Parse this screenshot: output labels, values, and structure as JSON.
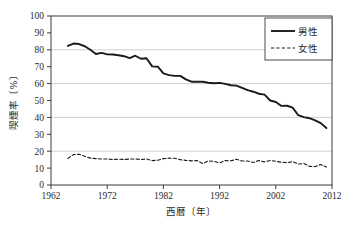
{
  "chart_data": {
    "type": "line",
    "title": "",
    "xlabel": "西暦〔年〕",
    "ylabel": "喫煙率〔%〕",
    "xlim": [
      1962,
      2012
    ],
    "ylim": [
      0,
      100
    ],
    "xticks": [
      1962,
      1972,
      1982,
      1992,
      2002,
      2012
    ],
    "yticks": [
      0,
      10,
      20,
      30,
      40,
      50,
      60,
      70,
      80,
      90,
      100
    ],
    "gridlines_y": [
      20,
      40,
      60,
      80
    ],
    "grid": true,
    "legend_position": "top-right",
    "x": [
      1965,
      1966,
      1967,
      1968,
      1969,
      1970,
      1971,
      1972,
      1973,
      1974,
      1975,
      1976,
      1977,
      1978,
      1979,
      1980,
      1981,
      1982,
      1983,
      1984,
      1985,
      1986,
      1987,
      1988,
      1989,
      1990,
      1991,
      1992,
      1993,
      1994,
      1995,
      1996,
      1997,
      1998,
      1999,
      2000,
      2001,
      2002,
      2003,
      2004,
      2005,
      2006,
      2007,
      2008,
      2009,
      2010,
      2011
    ],
    "series": [
      {
        "name": "男性",
        "style": "solid",
        "color": "#1a1a1a",
        "values": [
          82.3,
          83.7,
          83.4,
          82.1,
          80.0,
          77.5,
          78.2,
          77.3,
          77.2,
          76.8,
          76.2,
          75.1,
          76.5,
          74.7,
          75.0,
          70.2,
          70.0,
          66.0,
          65.0,
          64.6,
          64.6,
          62.5,
          61.1,
          61.1,
          61.1,
          60.5,
          60.2,
          60.4,
          59.8,
          59.0,
          58.8,
          57.5,
          56.1,
          55.2,
          54.0,
          53.5,
          50.0,
          49.1,
          46.8,
          46.9,
          45.8,
          41.3,
          40.2,
          39.5,
          38.2,
          36.6,
          33.7
        ]
      },
      {
        "name": "女性",
        "style": "dashed",
        "color": "#1a1a1a",
        "values": [
          15.7,
          18.0,
          18.2,
          17.0,
          15.9,
          15.6,
          15.4,
          15.4,
          15.1,
          15.3,
          15.1,
          15.4,
          15.4,
          15.1,
          15.4,
          14.4,
          14.7,
          15.6,
          15.9,
          15.8,
          15.0,
          14.6,
          14.3,
          14.5,
          12.7,
          14.3,
          14.0,
          13.1,
          14.5,
          14.3,
          15.2,
          14.2,
          14.2,
          13.3,
          14.5,
          13.7,
          14.5,
          14.0,
          13.5,
          13.2,
          13.8,
          12.4,
          12.7,
          11.0,
          10.9,
          12.1,
          10.6
        ]
      }
    ]
  },
  "legend": {
    "entries": [
      {
        "label": "男性",
        "style": "solid"
      },
      {
        "label": "女性",
        "style": "dashed"
      }
    ]
  },
  "axis": {
    "y_title": "喫煙率〔%〕",
    "x_title": "西暦〔年〕",
    "y_tick_labels": [
      "100",
      "90",
      "80",
      "70",
      "60",
      "50",
      "40",
      "30",
      "20",
      "10",
      "0"
    ],
    "x_tick_labels": [
      "1962",
      "1972",
      "1982",
      "1992",
      "2002",
      "2012"
    ]
  },
  "colors": {
    "line": "#1a1a1a",
    "grid": "#c9c9c9",
    "axis": "#3a3a3a",
    "background": "#ffffff"
  }
}
